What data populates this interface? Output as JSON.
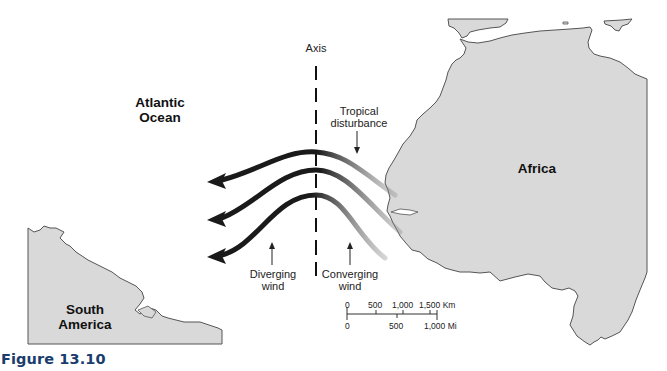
{
  "figure": {
    "caption": "Figure 13.10"
  },
  "labels": {
    "ocean": [
      "Atlantic",
      "Ocean"
    ],
    "africa": "Africa",
    "south_america": [
      "South",
      "America"
    ],
    "axis": "Axis",
    "tropical_disturbance": [
      "Tropical",
      "disturbance"
    ],
    "diverging_wind": [
      "Diverging",
      "wind"
    ],
    "converging_wind": [
      "Converging",
      "wind"
    ]
  },
  "scale_bar": {
    "km_ticks": [
      "0",
      "500",
      "1,000",
      "1,500 Km"
    ],
    "mi_ticks": [
      "0",
      "500",
      "1,000 Mi"
    ]
  },
  "colors": {
    "land": "#d9d9d9",
    "coast": "#555555",
    "arrow": "#1a1a1a",
    "caption": "#1a3d6e"
  },
  "map_features": {
    "wind_streamlines": 3,
    "arrow_direction": "west"
  }
}
